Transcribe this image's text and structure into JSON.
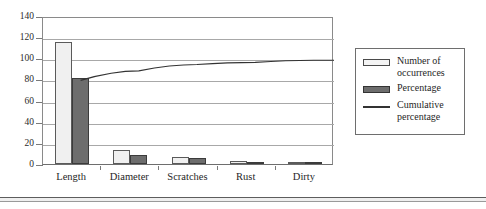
{
  "chart_data": {
    "type": "bar",
    "title": "",
    "xlabel": "",
    "ylabel": "",
    "ylim": [
      0,
      140
    ],
    "yticks": [
      0,
      20,
      40,
      60,
      80,
      100,
      120,
      140
    ],
    "grid": true,
    "legend_position": "right",
    "categories": [
      "Length",
      "Diameter",
      "Scratches",
      "Rust",
      "Dirty"
    ],
    "series": [
      {
        "name": "Number of occurrences",
        "type": "bar",
        "values": [
          115,
          13,
          7,
          3,
          2
        ]
      },
      {
        "name": "Percentage",
        "type": "bar",
        "values": [
          81,
          9,
          6,
          2,
          1.5
        ]
      },
      {
        "name": "Cumulative percentage",
        "type": "line",
        "values": [
          81,
          90,
          96,
          98,
          100
        ]
      }
    ]
  },
  "axis": {
    "y_tick_labels": [
      "140",
      "120",
      "100",
      "80",
      "60",
      "40",
      "20",
      "0"
    ],
    "x_tick_labels": [
      "Length",
      "Diameter",
      "Scratches",
      "Rust",
      "Dirty"
    ]
  },
  "legend": {
    "entries": [
      {
        "label": "Number of occurrences",
        "marker": "light-bar-swatch"
      },
      {
        "label": "Percentage",
        "marker": "dark-bar-swatch"
      },
      {
        "label": "Cumulative percentage",
        "marker": "line-swatch"
      }
    ]
  },
  "colors": {
    "light_bar_fill": "#f0f0f0",
    "light_bar_stroke": "#5a5a5a",
    "dark_bar_fill": "#6d6d6d",
    "dark_bar_stroke": "#3b3b3b",
    "line": "#333333",
    "grid": "#a8a8a8",
    "axis": "#7a7a7a"
  }
}
